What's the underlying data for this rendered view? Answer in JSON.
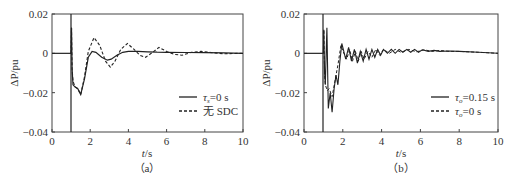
{
  "chart_data": [
    {
      "type": "line",
      "panel": "a",
      "caption": "（a）",
      "xlabel": "t/s",
      "ylabel": "ΔP/pu",
      "xlim": [
        0,
        10
      ],
      "ylim": [
        -0.04,
        0.02
      ],
      "xticks": [
        "0",
        "2",
        "4",
        "6",
        "8",
        "10"
      ],
      "yticks": [
        "0.02",
        "0",
        "-0.02",
        "-0.04"
      ],
      "grid": false,
      "legend_position": "lower right",
      "series": [
        {
          "name": "τs=0 s",
          "style": "solid",
          "x": [
            0,
            1.0,
            1.02,
            1.05,
            1.1,
            1.2,
            1.35,
            1.5,
            1.7,
            1.9,
            2.1,
            2.3,
            2.6,
            2.9,
            3.1,
            3.4,
            3.7,
            4.0,
            4.5,
            5.0,
            5.5,
            6.0,
            7.0,
            8.0,
            9.0,
            10.0
          ],
          "y": [
            0,
            0,
            0.013,
            -0.008,
            -0.016,
            -0.017,
            -0.018,
            -0.021,
            -0.013,
            -0.002,
            0.001,
            0.0005,
            -0.002,
            -0.0035,
            -0.003,
            -0.001,
            0.0005,
            0.001,
            0.001,
            0.0008,
            0.0006,
            0.0005,
            0.0004,
            0.0003,
            0.0002,
            0.0
          ]
        },
        {
          "name": "无 SDC",
          "style": "dashed",
          "x": [
            0,
            1.0,
            1.02,
            1.05,
            1.1,
            1.2,
            1.35,
            1.5,
            1.7,
            1.9,
            2.2,
            2.5,
            2.8,
            3.05,
            3.3,
            3.6,
            3.95,
            4.3,
            4.6,
            4.9,
            5.2,
            5.6,
            6.0,
            6.4,
            6.8,
            7.3,
            7.8,
            8.5,
            9.0,
            10.0
          ],
          "y": [
            0,
            0,
            0.013,
            -0.008,
            -0.014,
            -0.017,
            -0.018,
            -0.021,
            -0.012,
            0.001,
            0.008,
            0.004,
            -0.004,
            -0.007,
            -0.004,
            0.002,
            0.005,
            0.002,
            -0.001,
            -0.002,
            0.0,
            0.003,
            0.001,
            -0.0005,
            -0.001,
            0.0005,
            0.001,
            0.0002,
            -0.0002,
            0.0
          ]
        }
      ]
    },
    {
      "type": "line",
      "panel": "b",
      "caption": "（b）",
      "xlabel": "t/s",
      "ylabel": "ΔP/pu",
      "xlim": [
        0,
        10
      ],
      "ylim": [
        -0.04,
        0.02
      ],
      "xticks": [
        "0",
        "2",
        "4",
        "6",
        "8",
        "10"
      ],
      "yticks": [
        "0.02",
        "0",
        "-0.02",
        "-0.04"
      ],
      "grid": false,
      "legend_position": "lower right",
      "series": [
        {
          "name": "τo=0.15 s",
          "style": "solid",
          "x": [
            0,
            1.0,
            1.02,
            1.06,
            1.1,
            1.18,
            1.25,
            1.35,
            1.45,
            1.55,
            1.65,
            1.75,
            1.85,
            1.95,
            2.05,
            2.15,
            2.3,
            2.45,
            2.6,
            2.75,
            2.9,
            3.05,
            3.2,
            3.35,
            3.5,
            3.65,
            3.8,
            3.95,
            4.1,
            4.3,
            4.5,
            4.7,
            4.9,
            5.1,
            5.3,
            5.5,
            5.7,
            5.9,
            6.1,
            6.4,
            6.7,
            7.0,
            7.5,
            8.0,
            9.0,
            10.0
          ],
          "y": [
            0,
            0,
            0.012,
            -0.01,
            -0.016,
            0.013,
            -0.028,
            -0.02,
            -0.03,
            -0.018,
            -0.011,
            -0.016,
            -0.004,
            0.005,
            0.001,
            -0.003,
            0.003,
            -0.004,
            0.002,
            -0.005,
            0.001,
            -0.004,
            0.002,
            -0.003,
            0.002,
            -0.002,
            0.002,
            -0.001,
            0.002,
            0.0,
            0.002,
            0.0,
            0.002,
            0.0005,
            0.002,
            0.0005,
            0.002,
            0.0005,
            0.0018,
            0.001,
            0.0015,
            0.001,
            0.0012,
            0.001,
            0.0005,
            0.0
          ]
        },
        {
          "name": "τo=0 s",
          "style": "dashed",
          "x": [
            0,
            1.0,
            1.02,
            1.06,
            1.1,
            1.2,
            1.3,
            1.45,
            1.6,
            1.75,
            1.9,
            2.05,
            2.2,
            2.35,
            2.5,
            2.65,
            2.8,
            2.95,
            3.1,
            3.3,
            3.5,
            3.7,
            3.9,
            4.1,
            4.4,
            4.7,
            5.0,
            5.4,
            5.8,
            6.2,
            6.6,
            7.0,
            7.5,
            8.0,
            9.0,
            10.0
          ],
          "y": [
            0,
            0,
            0.012,
            -0.011,
            -0.016,
            -0.019,
            -0.018,
            -0.022,
            -0.014,
            -0.006,
            0.004,
            0.0,
            -0.003,
            0.002,
            -0.004,
            0.001,
            -0.004,
            0.001,
            -0.003,
            0.001,
            -0.002,
            0.002,
            -0.001,
            0.002,
            0.0,
            0.002,
            0.0005,
            0.002,
            0.0008,
            0.0018,
            0.001,
            0.0015,
            0.001,
            0.001,
            0.0005,
            0.0
          ]
        }
      ]
    }
  ],
  "panels": {
    "a": {
      "caption": "（a）",
      "xlabel_var": "t",
      "xlabel_unit": "/s",
      "ylabel": "ΔP/pu",
      "xticks": [
        "0",
        "2",
        "4",
        "6",
        "8",
        "10"
      ],
      "yticks": [
        "0.02",
        "0",
        "−0.02",
        "−0.04"
      ],
      "legend": [
        {
          "sym": "τ",
          "sub": "s",
          "rest": "=0 s",
          "style": "solid"
        },
        {
          "sym": "",
          "sub": "",
          "rest": "无 SDC",
          "style": "dashed"
        }
      ]
    },
    "b": {
      "caption": "（b）",
      "xlabel_var": "t",
      "xlabel_unit": "/s",
      "ylabel": "ΔP/pu",
      "xticks": [
        "0",
        "2",
        "4",
        "6",
        "8",
        "10"
      ],
      "yticks": [
        "0.02",
        "0",
        "−0.02",
        "−0.04"
      ],
      "legend": [
        {
          "sym": "τ",
          "sub": "o",
          "rest": "=0.15 s",
          "style": "solid"
        },
        {
          "sym": "τ",
          "sub": "o",
          "rest": "=0 s",
          "style": "dashed"
        }
      ]
    }
  }
}
